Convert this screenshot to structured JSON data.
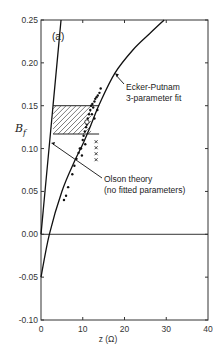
{
  "chart_data": {
    "type": "line",
    "panel_label": "(a)",
    "xlabel": "z (Ω)",
    "ylabel": "B_f",
    "xlim": [
      0,
      40
    ],
    "ylim": [
      -0.1,
      0.25
    ],
    "x_ticks": [
      0,
      10,
      20,
      30,
      40
    ],
    "x_tick_labels": [
      "0",
      "10",
      "20",
      "30",
      "40"
    ],
    "y_ticks": [
      -0.1,
      -0.05,
      0.0,
      0.05,
      0.1,
      0.15,
      0.2,
      0.25
    ],
    "y_tick_labels": [
      "-0.10",
      "-0.05",
      "0.00",
      "0.05",
      "0.10",
      "0.15",
      "0.20",
      "0.25"
    ],
    "grid": false,
    "reference_line_y": 0.0,
    "series": [
      {
        "name": "Ecker-Putnam 3-parameter fit",
        "style": "solid-curve",
        "x": [
          0,
          2,
          5,
          8,
          10,
          12,
          14,
          17.7,
          22,
          26,
          29.5
        ],
        "y": [
          -0.05,
          0.0,
          0.05,
          0.085,
          0.105,
          0.128,
          0.152,
          0.188,
          0.215,
          0.234,
          0.25
        ]
      },
      {
        "name": "Olson theory (no fitted parameters)",
        "style": "solid-line",
        "x": [
          0,
          4.8
        ],
        "y": [
          0.0,
          0.25
        ]
      },
      {
        "name": "Experimental data",
        "style": "dots",
        "x": [
          5.5,
          6.0,
          6.5,
          7.5,
          8.0,
          8.5,
          9.0,
          9.3,
          9.6,
          10.0,
          10.2,
          10.5,
          10.8,
          11.0,
          11.2,
          11.5,
          11.8,
          12.0,
          12.3,
          12.5,
          12.8,
          13.0,
          13.3,
          13.6,
          14.0,
          14.3,
          12.2,
          12.8,
          13.5,
          9.8,
          10.6
        ],
        "y": [
          0.04,
          0.045,
          0.055,
          0.07,
          0.08,
          0.088,
          0.095,
          0.1,
          0.1,
          0.11,
          0.115,
          0.12,
          0.125,
          0.128,
          0.135,
          0.14,
          0.145,
          0.15,
          0.152,
          0.148,
          0.155,
          0.158,
          0.16,
          0.162,
          0.165,
          0.17,
          0.14,
          0.135,
          0.145,
          0.092,
          0.105
        ]
      },
      {
        "name": "Crossed markers",
        "style": "x-markers",
        "x": [
          13.2,
          13.2,
          13.2,
          13.2
        ],
        "y": [
          0.108,
          0.101,
          0.094,
          0.087
        ]
      },
      {
        "name": "Open circle",
        "style": "open-circle",
        "x": [
          11.0
        ],
        "y": [
          0.131
        ]
      }
    ],
    "shaded_region": {
      "name": "hatched-range",
      "x": [
        2.9,
        12.0
      ],
      "y": [
        0.117,
        0.15
      ]
    },
    "annotations": [
      {
        "text_lines": [
          "Ecker-Putnam",
          "3-parameter fit"
        ],
        "points_to": {
          "x": 17.7,
          "y": 0.188
        }
      },
      {
        "text_lines": [
          "Olson theory",
          "(no fitted parameters)"
        ],
        "points_to": {
          "x": 2.4,
          "y": 0.11
        }
      }
    ]
  }
}
